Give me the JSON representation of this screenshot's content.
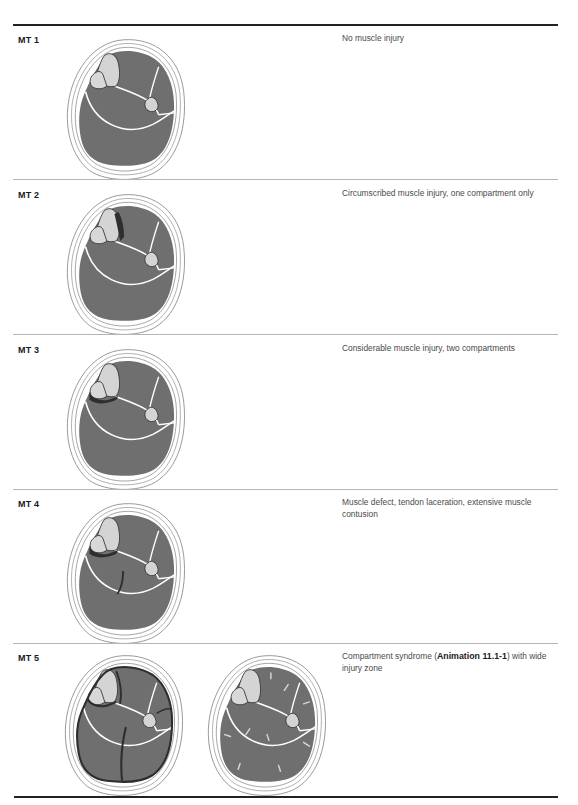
{
  "colors": {
    "muscle": "#6f6f6f",
    "skin_ring": "#ffffff",
    "outline": "#8a8a8a",
    "bone": "#d4d4d4",
    "bone_outline": "#333333",
    "injury": "#2e2e2e",
    "septum": "#ffffff",
    "rule": "#222222",
    "divider": "#b5b5b5"
  },
  "rows": [
    {
      "label": "MT 1",
      "description": "No muscle injury",
      "injury_level": 1
    },
    {
      "label": "MT 2",
      "description": "Circumscribed muscle injury, one compartment only",
      "injury_level": 2
    },
    {
      "label": "MT 3",
      "description": "Considerable muscle injury, two compartments",
      "injury_level": 3
    },
    {
      "label": "MT 4",
      "description": "Muscle defect, tendon laceration, extensive muscle contusion",
      "injury_level": 4
    },
    {
      "label": "MT 5",
      "description_pre": "Compartment syndrome (",
      "description_link": "Animation 11.1-1",
      "description_post": ") with wide injury zone",
      "injury_level": 5
    }
  ]
}
